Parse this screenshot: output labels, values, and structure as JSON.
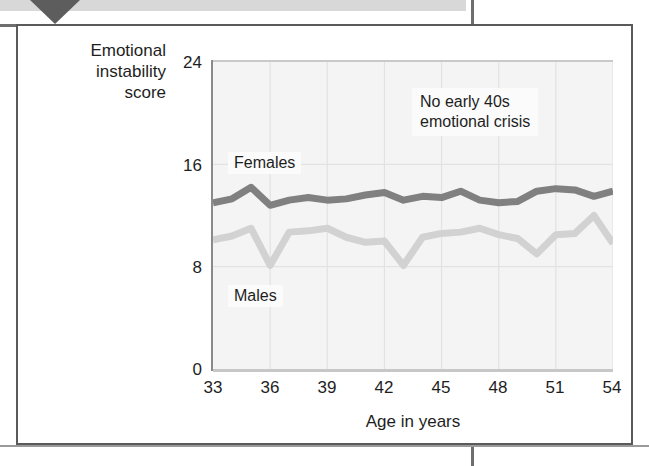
{
  "figure": {
    "y_axis_title": "Emotional\ninstability\nscore",
    "x_axis_title": "Age in years"
  },
  "labels": {
    "females": "Females",
    "males": "Males",
    "annotation": "No early 40s\nemotional crisis"
  },
  "colors": {
    "females_line": "#808080",
    "males_line": "#d2d2d2",
    "plot_background": "#f4f4f4",
    "gridline": "#e2e2e2",
    "axis": "#8a8a8a",
    "frame": "#5a5a5a",
    "text": "#1e1e1e"
  },
  "chart_data": {
    "type": "line",
    "title": "",
    "subtitle": "",
    "xlabel": "Age in years",
    "ylabel": "Emotional instability score",
    "xlim": [
      33,
      54
    ],
    "ylim": [
      0,
      24
    ],
    "xticks": [
      33,
      36,
      39,
      42,
      45,
      48,
      51,
      54
    ],
    "yticks": [
      0,
      8,
      16,
      24
    ],
    "grid": true,
    "legend_position": "inline-labels",
    "annotations": [
      {
        "text": "No early 40s emotional crisis",
        "x": 46.5,
        "y": 20.5
      }
    ],
    "x": [
      33,
      34,
      35,
      36,
      37,
      38,
      39,
      40,
      41,
      42,
      43,
      44,
      45,
      46,
      47,
      48,
      49,
      50,
      51,
      52,
      53,
      54
    ],
    "series": [
      {
        "name": "Females",
        "color": "#808080",
        "values": [
          13.0,
          13.3,
          14.2,
          12.8,
          13.2,
          13.4,
          13.2,
          13.3,
          13.6,
          13.8,
          13.2,
          13.5,
          13.4,
          13.9,
          13.2,
          13.0,
          13.1,
          13.9,
          14.1,
          14.0,
          13.5,
          13.9
        ]
      },
      {
        "name": "Males",
        "color": "#d2d2d2",
        "values": [
          10.1,
          10.4,
          11.0,
          8.1,
          10.7,
          10.8,
          11.0,
          10.3,
          9.9,
          10.0,
          8.1,
          10.3,
          10.6,
          10.7,
          11.0,
          10.5,
          10.2,
          9.0,
          10.5,
          10.6,
          12.0,
          9.8
        ]
      }
    ]
  }
}
